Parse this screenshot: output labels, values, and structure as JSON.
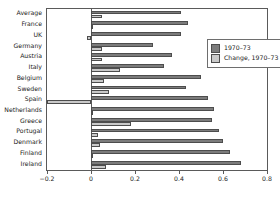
{
  "chart_data": {
    "type": "bar",
    "orientation": "horizontal",
    "title": "",
    "subtitle": "",
    "xlabel": "",
    "ylabel": "",
    "xlim": [
      -0.2,
      0.8
    ],
    "xticks": [
      -0.2,
      0,
      0.2,
      0.4,
      0.6,
      0.8
    ],
    "xticklabels": [
      "−0.2",
      "0",
      "0.2",
      "0.4",
      "0.6",
      "0.8"
    ],
    "grid": false,
    "legend_position": "upper-right-inside",
    "categories": [
      "Average",
      "France",
      "UK",
      "Germany",
      "Austria",
      "Italy",
      "Belgium",
      "Sweden",
      "Spain",
      "Netherlands",
      "Greece",
      "Portugal",
      "Denmark",
      "Finland",
      "Ireland"
    ],
    "series": [
      {
        "name": "1970–73",
        "color": "#7c7c7c",
        "values": [
          0.41,
          0.44,
          0.41,
          0.28,
          0.37,
          0.33,
          0.5,
          0.43,
          0.53,
          0.56,
          0.55,
          0.58,
          0.6,
          0.63,
          0.68
        ]
      },
      {
        "name": "Change, 1970–73 to 1994–97",
        "color": "#c9c9c9",
        "values": [
          0.05,
          0.01,
          -0.02,
          0.05,
          0.05,
          0.13,
          0.06,
          0.08,
          -0.2,
          0.01,
          0.18,
          0.03,
          0.04,
          0.01,
          0.07
        ]
      }
    ]
  },
  "legend": {
    "items": [
      {
        "label": "1970–73",
        "color": "#7c7c7c"
      },
      {
        "label": "Change, 1970–73 to 1994–97",
        "color": "#c9c9c9"
      }
    ]
  },
  "colors": {
    "series_1970_73": "#7c7c7c",
    "series_change": "#c9c9c9",
    "axis": "#5a5a5a",
    "text": "#1a1a1a",
    "background": "#ffffff"
  }
}
